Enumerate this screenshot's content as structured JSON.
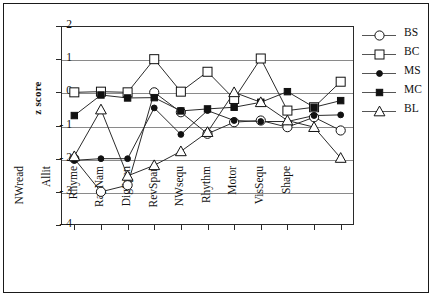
{
  "chart_data": {
    "type": "line",
    "title": "",
    "xlabel": "",
    "ylabel": "z score",
    "ylim": [
      -4,
      2
    ],
    "yticks": [
      "2",
      "1",
      "0",
      "- 1",
      "- 2",
      "- 3",
      "- 4"
    ],
    "ytick_values": [
      2,
      1,
      0,
      -1,
      -2,
      -3,
      -4
    ],
    "grid": true,
    "legend_position": "right",
    "categories": [
      "NWread",
      "Allit",
      "Rhyme",
      "RapNam",
      "DigSpan",
      "RevSpan",
      "NWsequ",
      "Rhythm",
      "Motor",
      "VisSequ",
      "Shape"
    ],
    "series": [
      {
        "name": "BS",
        "marker": "open-circle",
        "values": [
          -2.0,
          -3.0,
          -2.8,
          0.0,
          -0.6,
          -1.25,
          -0.9,
          -0.85,
          -1.05,
          -0.75,
          -1.15
        ]
      },
      {
        "name": "BC",
        "marker": "open-square",
        "values": [
          0.0,
          0.02,
          0.0,
          1.0,
          0.02,
          0.62,
          -0.2,
          1.02,
          -0.55,
          -0.45,
          0.32
        ]
      },
      {
        "name": "MS",
        "marker": "filled-circle",
        "values": [
          -2.05,
          -2.0,
          -2.0,
          -0.47,
          -1.27,
          -0.55,
          -0.85,
          -0.88,
          -0.88,
          -0.7,
          -0.68
        ]
      },
      {
        "name": "MC",
        "marker": "filled-square",
        "values": [
          -0.7,
          -0.08,
          -0.17,
          -0.16,
          -0.56,
          -0.5,
          -0.45,
          -0.3,
          0.02,
          -0.45,
          -0.25
        ]
      },
      {
        "name": "BL",
        "marker": "open-triangle",
        "values": [
          -1.93,
          -0.52,
          -2.52,
          -2.2,
          -1.78,
          -1.2,
          0.0,
          -0.3,
          -0.85,
          -1.05,
          -1.98
        ]
      }
    ]
  },
  "legend": {
    "entries": [
      {
        "label": "BS"
      },
      {
        "label": "BC"
      },
      {
        "label": "MS"
      },
      {
        "label": "MC"
      },
      {
        "label": "BL"
      }
    ]
  }
}
